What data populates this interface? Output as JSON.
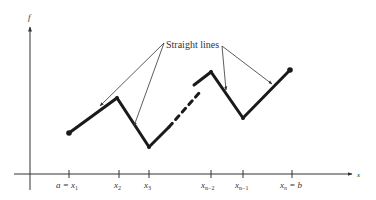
{
  "figure": {
    "y_axis_label": "f",
    "x_axis_label": "x",
    "annotation": "Straight lines",
    "tick_labels": {
      "x1": {
        "pre": "a = ",
        "var": "x",
        "sub": "1"
      },
      "x2": {
        "var": "x",
        "sub": "2"
      },
      "x3": {
        "var": "x",
        "sub": "3"
      },
      "xn2": {
        "var": "x",
        "sub": "n−2"
      },
      "xn1": {
        "var": "x",
        "sub": "n−1"
      },
      "xn": {
        "var": "x",
        "sub": "n",
        "post": " = b"
      }
    },
    "colors": {
      "line": "#1a1a1a",
      "axis": "#333333",
      "text": "#333333"
    }
  }
}
